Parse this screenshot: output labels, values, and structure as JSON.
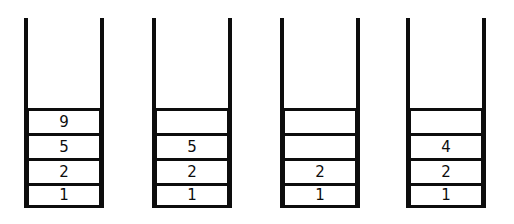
{
  "diagram": {
    "colors": {
      "stroke": "#0d0d0d",
      "fill": "#ffffff",
      "background": "#ffffff"
    },
    "capacity": 4,
    "stacks": [
      {
        "name": "stack-1",
        "x": 24,
        "cells_top_to_bottom": [
          "9",
          "5",
          "2",
          "1"
        ],
        "empty_top_to_bottom": [
          false,
          false,
          false,
          false
        ]
      },
      {
        "name": "stack-2",
        "x": 152,
        "cells_top_to_bottom": [
          "",
          "5",
          "2",
          "1"
        ],
        "empty_top_to_bottom": [
          true,
          false,
          false,
          false
        ]
      },
      {
        "name": "stack-3",
        "x": 280,
        "cells_top_to_bottom": [
          "",
          "",
          "2",
          "1"
        ],
        "empty_top_to_bottom": [
          true,
          true,
          false,
          false
        ]
      },
      {
        "name": "stack-4",
        "x": 406,
        "cells_top_to_bottom": [
          "",
          "4",
          "2",
          "1"
        ],
        "empty_top_to_bottom": [
          true,
          false,
          false,
          false
        ]
      }
    ]
  }
}
